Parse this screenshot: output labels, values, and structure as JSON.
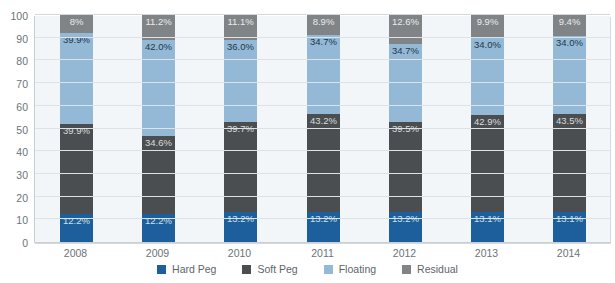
{
  "chart_data": {
    "type": "bar",
    "title": "",
    "subtitle": "",
    "xlabel": "",
    "ylabel": "",
    "ylim": [
      0,
      100
    ],
    "yticks": [
      0,
      10,
      20,
      30,
      40,
      50,
      60,
      70,
      80,
      90,
      100
    ],
    "ytick_labels": [
      "0",
      "10",
      "20",
      "30",
      "40",
      "50",
      "60",
      "70",
      "80",
      "90",
      "100"
    ],
    "grid": true,
    "stacked": true,
    "legend_position": "bottom",
    "categories": [
      "2008",
      "2009",
      "2010",
      "2011",
      "2012",
      "2013",
      "2014"
    ],
    "series": [
      {
        "name": "Hard Peg",
        "color": "#1d5f9c",
        "values": [
          12.2,
          12.2,
          13.2,
          13.2,
          13.2,
          13.1,
          13.1
        ],
        "labels": [
          "12.2%",
          "12.2%",
          "13.2%",
          "13.2%",
          "13.2%",
          "13.1%",
          "13.1%"
        ]
      },
      {
        "name": "Soft Peg",
        "color": "#4b4e50",
        "values": [
          39.9,
          34.6,
          39.7,
          43.2,
          39.5,
          42.9,
          43.5
        ],
        "labels": [
          "39.9%",
          "34.6%",
          "39.7%",
          "43.2%",
          "39.5%",
          "42.9%",
          "43.5%"
        ]
      },
      {
        "name": "Floating",
        "color": "#94b9d7",
        "values": [
          39.9,
          42.0,
          36.0,
          34.7,
          34.7,
          34.0,
          34.0
        ],
        "labels": [
          "39.9%",
          "42.0%",
          "36.0%",
          "34.7%",
          "34.7%",
          "34.0%",
          "34.0%"
        ]
      },
      {
        "name": "Residual",
        "color": "#808487",
        "values": [
          8.0,
          11.2,
          11.1,
          8.9,
          12.6,
          9.9,
          9.4
        ],
        "labels": [
          "8%",
          "11.2%",
          "11.1%",
          "8.9%",
          "12.6%",
          "9.9%",
          "9.4%"
        ]
      }
    ]
  },
  "legend": {
    "items": [
      {
        "label": "Hard Peg",
        "color": "#1d5f9c"
      },
      {
        "label": "Soft Peg",
        "color": "#4b4e50"
      },
      {
        "label": "Floating",
        "color": "#94b9d7"
      },
      {
        "label": "Residual",
        "color": "#808487"
      }
    ]
  },
  "clipped_title": ""
}
